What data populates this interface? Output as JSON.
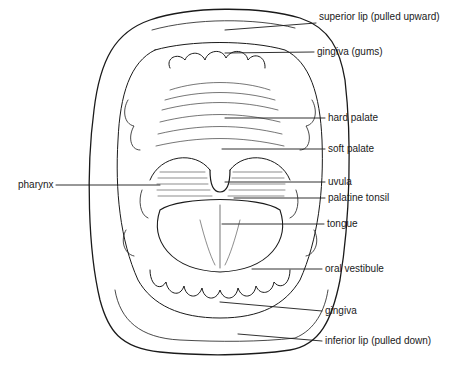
{
  "diagram": {
    "line_color": "#1a1a1a",
    "background": "#ffffff",
    "labels": [
      {
        "id": "superior-lip",
        "text": "superior lip (pulled upward)",
        "x": 319,
        "y": 17
      },
      {
        "id": "gingiva-gums",
        "text": "gingiva  (gums)",
        "x": 317,
        "y": 46
      },
      {
        "id": "hard-palate",
        "text": "hard palate",
        "x": 328,
        "y": 112
      },
      {
        "id": "soft-palate",
        "text": "soft palate",
        "x": 328,
        "y": 143
      },
      {
        "id": "uvula",
        "text": "uvula",
        "x": 328,
        "y": 176
      },
      {
        "id": "palatine-tonsil",
        "text": "palatine tonsil",
        "x": 328,
        "y": 193
      },
      {
        "id": "tongue",
        "text": "tongue",
        "x": 327,
        "y": 218
      },
      {
        "id": "oral-vestibule",
        "text": "oral vestibule",
        "x": 325,
        "y": 263
      },
      {
        "id": "gingiva",
        "text": "gingiva",
        "x": 325,
        "y": 305
      },
      {
        "id": "inferior-lip",
        "text": "inferior lip (pulled down)",
        "x": 325,
        "y": 335
      },
      {
        "id": "pharynx",
        "text": "pharynx",
        "x": 18,
        "y": 179
      }
    ]
  }
}
